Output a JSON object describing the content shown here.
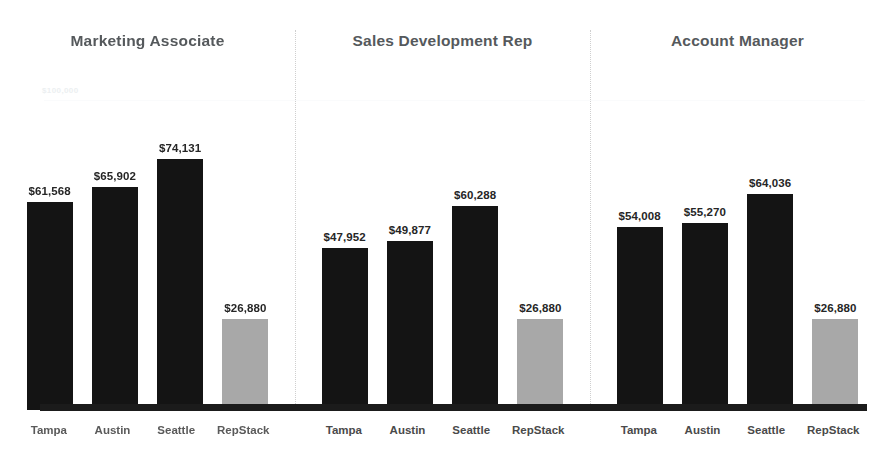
{
  "chart_data": {
    "type": "bar",
    "title": "",
    "subtitle": "",
    "xlabel": "",
    "ylabel": "",
    "ylim": [
      0,
      100000
    ],
    "grid": true,
    "legend": null,
    "yaxis_reference_label": "$100,000",
    "categories": [
      "Tampa",
      "Austin",
      "Seattle",
      "RepStack"
    ],
    "panels": [
      {
        "title": "Marketing Associate",
        "categories": [
          "Tampa",
          "Austin",
          "Seattle",
          "RepStack"
        ],
        "values": [
          61568,
          65902,
          74131,
          26880
        ],
        "value_labels": [
          "$61,568",
          "$65,902",
          "$74,131",
          "$26,880"
        ],
        "highlight_index": 3
      },
      {
        "title": "Sales Development Rep",
        "categories": [
          "Tampa",
          "Austin",
          "Seattle",
          "RepStack"
        ],
        "values": [
          47952,
          49877,
          60288,
          26880
        ],
        "value_labels": [
          "$47,952",
          "$49,877",
          "$60,288",
          "$26,880"
        ],
        "highlight_index": 3
      },
      {
        "title": "Account Manager",
        "categories": [
          "Tampa",
          "Austin",
          "Seattle",
          "RepStack"
        ],
        "values": [
          54008,
          55270,
          64036,
          26880
        ],
        "value_labels": [
          "$54,008",
          "$55,270",
          "$64,036",
          "$26,880"
        ],
        "highlight_index": 3
      }
    ]
  },
  "colors": {
    "bar_dark": "#141414",
    "bar_highlight": "#a8a8a8",
    "baseline": "#1b1b1b",
    "title_text": "#55595c",
    "value_text": "#262626",
    "tick_text": "#4a4a4a",
    "divider": "#cfcfcf",
    "axis_label": "#eceff1",
    "background": "#ffffff"
  }
}
